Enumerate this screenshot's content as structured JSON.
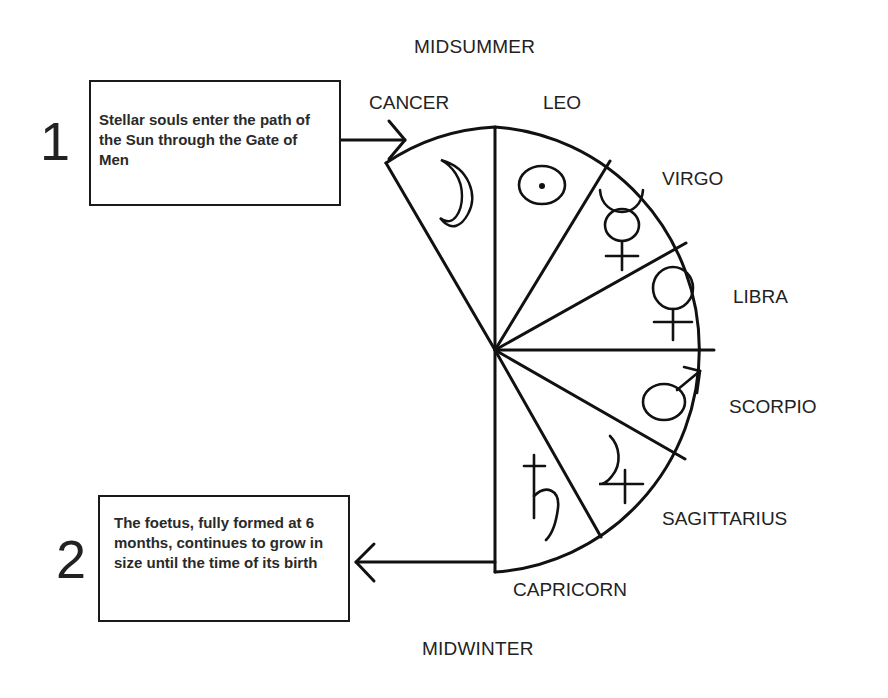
{
  "seasons": {
    "top": "MIDSUMMER",
    "bottom": "MIDWINTER"
  },
  "signs": [
    {
      "name": "CANCER",
      "planet": "Moon",
      "glyph": "moon-icon"
    },
    {
      "name": "LEO",
      "planet": "Sun",
      "glyph": "sun-icon"
    },
    {
      "name": "VIRGO",
      "planet": "Mercury",
      "glyph": "mercury-icon"
    },
    {
      "name": "LIBRA",
      "planet": "Venus",
      "glyph": "venus-icon"
    },
    {
      "name": "SCORPIO",
      "planet": "Mars",
      "glyph": "mars-icon"
    },
    {
      "name": "SAGITTARIUS",
      "planet": "Jupiter",
      "glyph": "jupiter-icon"
    },
    {
      "name": "CAPRICORN",
      "planet": "Saturn",
      "glyph": "saturn-icon"
    }
  ],
  "notes": [
    {
      "number": "1",
      "text": "Stellar souls enter the path of the Sun through the Gate of Men",
      "arrow": "right"
    },
    {
      "number": "2",
      "text": "The foetus, fully formed at 6 months, continues to grow in size until the time of its birth",
      "arrow": "left"
    }
  ],
  "colors": {
    "line": "#111111",
    "background": "#ffffff",
    "text": "#222222"
  }
}
